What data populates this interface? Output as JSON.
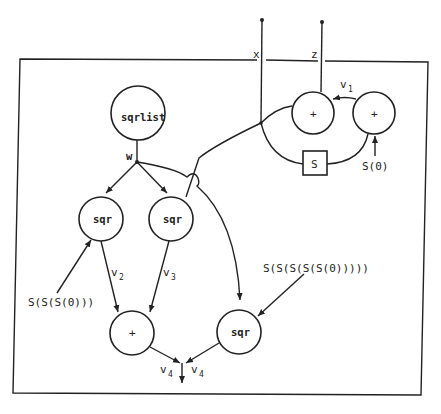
{
  "diagram": {
    "nodes": [
      {
        "id": "sqrlist",
        "label": "sqrlist"
      },
      {
        "id": "sqr1",
        "label": "sqr"
      },
      {
        "id": "sqr2",
        "label": "sqr"
      },
      {
        "id": "sqr3",
        "label": "sqr"
      },
      {
        "id": "plus_bottom",
        "label": "+"
      },
      {
        "id": "plus_left",
        "label": "+"
      },
      {
        "id": "plus_right",
        "label": "+"
      },
      {
        "id": "s_box",
        "label": "S"
      }
    ],
    "labels": {
      "x": "x",
      "z": "z",
      "w": "w",
      "v1": "v",
      "v1_sub": "1",
      "v2": "v",
      "v2_sub": "2",
      "v3": "v",
      "v3_sub": "3",
      "v4a": "v",
      "v4a_sub": "4",
      "v4b": "v",
      "v4b_sub": "4",
      "s0": "S(0)",
      "s3": "S(S(S(0)))",
      "s5": "S(S(S(S(S(0)))))"
    }
  }
}
